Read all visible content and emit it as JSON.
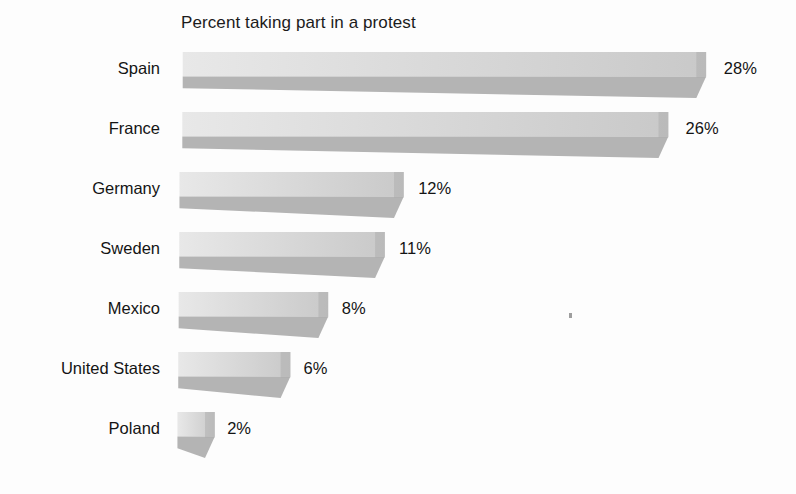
{
  "chart_data": {
    "type": "bar",
    "orientation": "horizontal",
    "title": "Percent taking part in a protest",
    "xlabel": "",
    "ylabel": "",
    "categories": [
      "Spain",
      "France",
      "Germany",
      "Sweden",
      "Mexico",
      "United States",
      "Poland"
    ],
    "values": [
      28,
      26,
      12,
      11,
      8,
      6,
      2
    ],
    "value_labels": [
      "28%",
      "26%",
      "12%",
      "11%",
      "8%",
      "6%",
      "2%"
    ],
    "value_suffix": "%",
    "xlim": [
      0,
      28
    ],
    "grid": false,
    "legend": false,
    "style": "3d-shadow-bar",
    "colors": {
      "bar_top_face_light": "#e8e8e8",
      "bar_top_face_dark": "#c9c9c9",
      "bar_bottom_face": "#b4b4b4",
      "bar_end_cap": "#a9a9a9",
      "text": "#141414",
      "background": "#fdfdfd"
    }
  },
  "bars": [
    {
      "label": "Spain",
      "value": 28,
      "value_label": "28%"
    },
    {
      "label": "France",
      "value": 26,
      "value_label": "26%"
    },
    {
      "label": "Germany",
      "value": 12,
      "value_label": "12%"
    },
    {
      "label": "Sweden",
      "value": 11,
      "value_label": "11%"
    },
    {
      "label": "Mexico",
      "value": 8,
      "value_label": "8%"
    },
    {
      "label": "United States",
      "value": 6,
      "value_label": "6%"
    },
    {
      "label": "Poland",
      "value": 2,
      "value_label": "2%"
    }
  ]
}
